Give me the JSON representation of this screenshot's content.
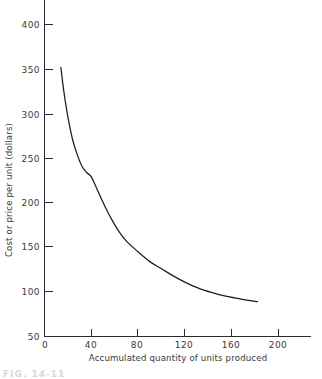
{
  "figure": {
    "caption_fragment": "FIG. 14-11"
  },
  "chart_data": {
    "type": "line",
    "title": "",
    "subtitle": "",
    "xlabel": "Accumulated quantity of units produced",
    "ylabel": "Cost or price per unit (dollars)",
    "xlim": [
      0,
      230
    ],
    "ylim": [
      50,
      420
    ],
    "x_ticks": [
      0,
      40,
      80,
      120,
      160,
      200
    ],
    "x_tick_labels": [
      "0",
      "40",
      "80",
      "120",
      "160",
      "200"
    ],
    "y_ticks": [
      50,
      100,
      150,
      200,
      250,
      300,
      350,
      400
    ],
    "y_tick_labels": [
      "50",
      "100",
      "150",
      "200",
      "250",
      "300",
      "350",
      "400"
    ],
    "grid": false,
    "legend": null,
    "legend_position": "none",
    "line_color": "#1d1d1d",
    "axis_color": "#2b2b2b",
    "background_color": "#ffffff",
    "series": [
      {
        "name": "Learning curve",
        "x": [
          14,
          16,
          18,
          20,
          24,
          28,
          32,
          36,
          40,
          46,
          52,
          58,
          64,
          70,
          80,
          90,
          100,
          110,
          120,
          132,
          144,
          156,
          168,
          182
        ],
        "values": [
          352,
          330,
          312,
          296,
          271,
          254,
          241,
          234,
          229,
          212,
          195,
          180,
          167,
          157,
          145,
          134,
          126,
          118,
          111,
          104,
          99,
          95,
          92,
          89
        ]
      }
    ]
  }
}
